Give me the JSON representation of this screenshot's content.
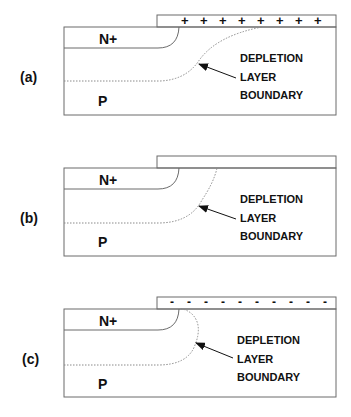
{
  "colors": {
    "line": "#6b6b6b",
    "text": "#111111",
    "dotted": "#8a8a8a",
    "background": "#ffffff"
  },
  "panels": [
    {
      "id": "a",
      "label": "(a)",
      "n_region": "N+",
      "p_region": "P",
      "gate_charge": "+",
      "gate_charge_count": 8,
      "annotation": [
        "DEPLETION",
        "LAYER",
        "BOUNDARY"
      ]
    },
    {
      "id": "b",
      "label": "(b)",
      "n_region": "N+",
      "p_region": "P",
      "gate_charge": "",
      "gate_charge_count": 0,
      "annotation": [
        "DEPLETION",
        "LAYER",
        "BOUNDARY"
      ]
    },
    {
      "id": "c",
      "label": "(c)",
      "n_region": "N+",
      "p_region": "P",
      "gate_charge": "-",
      "gate_charge_count": 10,
      "annotation": [
        "DEPLETION",
        "LAYER",
        "BOUNDARY"
      ]
    }
  ]
}
